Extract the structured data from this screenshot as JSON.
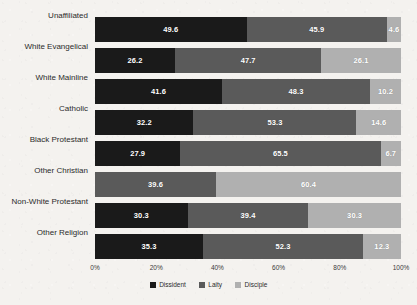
{
  "chart_data": {
    "type": "bar",
    "orientation": "horizontal",
    "stacked": true,
    "normalized": "100%",
    "title": "",
    "xlabel": "",
    "ylabel": "",
    "xlim": [
      0,
      100
    ],
    "xticks": [
      "0%",
      "20%",
      "40%",
      "60%",
      "80%",
      "100%"
    ],
    "xtick_values": [
      0,
      20,
      40,
      60,
      80,
      100
    ],
    "grid": false,
    "legend_position": "bottom-center",
    "categories": [
      "Unaffiliated",
      "White Evangelical",
      "White Mainline",
      "Catholic",
      "Black Protestant",
      "Other Christian",
      "Non-White Protestant",
      "Other Religion"
    ],
    "series": [
      {
        "name": "Dissident",
        "color": "#1a1a1a",
        "values": [
          49.6,
          26.2,
          41.6,
          32.2,
          27.9,
          0,
          30.3,
          35.3
        ],
        "labels": [
          "49.6",
          "26.2",
          "41.6",
          "32.2",
          "27.9",
          "",
          "30.3",
          "35.3"
        ]
      },
      {
        "name": "Laity",
        "color": "#5a5a5a",
        "values": [
          45.9,
          47.7,
          48.3,
          53.3,
          65.5,
          39.6,
          39.4,
          52.3
        ],
        "labels": [
          "45.9",
          "47.7",
          "48.3",
          "53.3",
          "65.5",
          "39.6",
          "39.4",
          "52.3"
        ]
      },
      {
        "name": "Disciple",
        "color": "#b0b0b0",
        "values": [
          4.6,
          26.1,
          10.2,
          14.6,
          6.7,
          60.4,
          30.3,
          12.3
        ],
        "labels": [
          "4.6",
          "26.1",
          "10.2",
          "14.6",
          "6.7",
          "60.4",
          "30.3",
          "12.3"
        ]
      }
    ]
  },
  "colors": {
    "background": "#f4f2ef",
    "dissident": "#1a1a1a",
    "laity": "#5a5a5a",
    "disciple": "#b0b0b0",
    "label_text": "#ffffff",
    "axis_text": "#2b2b2b"
  }
}
